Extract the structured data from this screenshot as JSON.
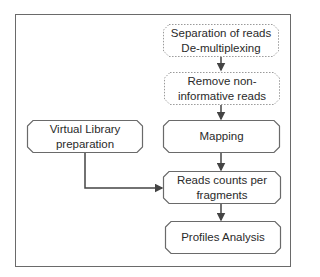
{
  "diagram": {
    "type": "flowchart",
    "nodes": [
      {
        "id": "separation",
        "label": "Separation of reads De-multiplexing",
        "lines": [
          "Separation of reads",
          "De-multiplexing"
        ],
        "style": "dotted"
      },
      {
        "id": "remove",
        "label": "Remove non-informative reads",
        "lines": [
          "Remove non-",
          "informative reads"
        ],
        "style": "dotted"
      },
      {
        "id": "mapping",
        "label": "Mapping",
        "lines": [
          "Mapping"
        ],
        "style": "solid"
      },
      {
        "id": "virtual",
        "label": "Virtual Library preparation",
        "lines": [
          "Virtual Library",
          "preparation"
        ],
        "style": "solid"
      },
      {
        "id": "counts",
        "label": "Reads counts per fragments",
        "lines": [
          "Reads counts per",
          "fragments"
        ],
        "style": "solid"
      },
      {
        "id": "profiles",
        "label": "Profiles Analysis",
        "lines": [
          "Profiles Analysis"
        ],
        "style": "solid"
      }
    ],
    "edges": [
      {
        "from": "separation",
        "to": "remove"
      },
      {
        "from": "remove",
        "to": "mapping"
      },
      {
        "from": "mapping",
        "to": "counts"
      },
      {
        "from": "virtual",
        "to": "counts"
      },
      {
        "from": "counts",
        "to": "profiles"
      }
    ],
    "colors": {
      "border": "#6a6a6a",
      "dotted_border": "#9a9a9a",
      "arrow": "#444444",
      "text": "#2a2a2a"
    }
  }
}
